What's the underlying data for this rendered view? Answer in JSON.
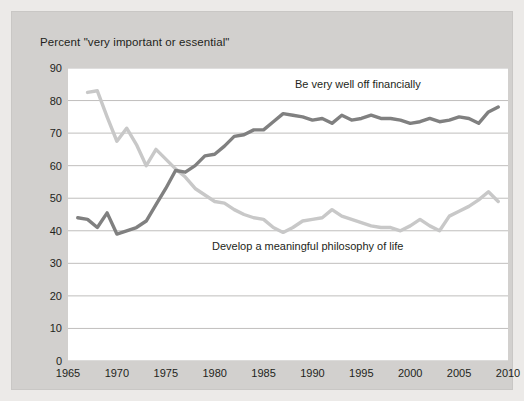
{
  "chart_data": {
    "type": "line",
    "title": "Percent \"very important or essential\"",
    "xlabel": "",
    "ylabel": "",
    "xlim": [
      1965,
      2010
    ],
    "ylim": [
      0,
      90
    ],
    "ytick_values": [
      0,
      10,
      20,
      30,
      40,
      50,
      60,
      70,
      80,
      90
    ],
    "ytick_labels": [
      "0",
      "10",
      "20",
      "30",
      "40",
      "50",
      "60",
      "70",
      "80",
      "90"
    ],
    "xtick_values": [
      1965,
      1970,
      1975,
      1980,
      1985,
      1990,
      1995,
      2000,
      2005,
      2010
    ],
    "xtick_labels": [
      "1965",
      "1970",
      "1975",
      "1980",
      "1985",
      "1990",
      "1995",
      "2000",
      "2005",
      "2010"
    ],
    "grid": "horizontal",
    "legend_position": "inline-annotations",
    "series": [
      {
        "name": "Be very well off financially",
        "color": "#808080",
        "x": [
          1966,
          1967,
          1968,
          1969,
          1970,
          1971,
          1972,
          1973,
          1974,
          1975,
          1976,
          1977,
          1978,
          1979,
          1980,
          1981,
          1982,
          1983,
          1984,
          1985,
          1986,
          1987,
          1988,
          1989,
          1990,
          1991,
          1992,
          1993,
          1994,
          1995,
          1996,
          1997,
          1998,
          1999,
          2000,
          2001,
          2002,
          2003,
          2004,
          2005,
          2006,
          2007,
          2008,
          2009
        ],
        "values": [
          44.0,
          43.5,
          41.0,
          45.5,
          39.0,
          40.0,
          41.0,
          43.0,
          48.0,
          53.0,
          58.5,
          58.0,
          60.0,
          63.0,
          63.5,
          66.0,
          69.0,
          69.5,
          71.0,
          71.0,
          73.5,
          76.0,
          75.5,
          75.0,
          74.0,
          74.5,
          73.0,
          75.5,
          74.0,
          74.5,
          75.5,
          74.5,
          74.5,
          74.0,
          73.0,
          73.5,
          74.5,
          73.5,
          74.0,
          75.0,
          74.5,
          73.0,
          76.5,
          78.0
        ]
      },
      {
        "name": "Develop a meaningful philosophy of life",
        "color": "#c8c8c8",
        "x": [
          1967,
          1968,
          1969,
          1970,
          1971,
          1972,
          1973,
          1974,
          1975,
          1976,
          1977,
          1978,
          1979,
          1980,
          1981,
          1982,
          1983,
          1984,
          1985,
          1986,
          1987,
          1988,
          1989,
          1990,
          1991,
          1992,
          1993,
          1994,
          1995,
          1996,
          1997,
          1998,
          1999,
          2000,
          2001,
          2002,
          2003,
          2004,
          2005,
          2006,
          2007,
          2008,
          2009
        ],
        "values": [
          82.5,
          83.0,
          75.0,
          67.5,
          71.5,
          66.5,
          60.0,
          65.0,
          62.0,
          59.0,
          56.5,
          53.0,
          51.0,
          49.0,
          48.5,
          46.5,
          45.0,
          44.0,
          43.5,
          41.0,
          39.5,
          41.0,
          43.0,
          43.5,
          44.0,
          46.5,
          44.5,
          43.5,
          42.5,
          41.5,
          41.0,
          41.0,
          40.0,
          41.5,
          43.5,
          41.5,
          40.0,
          44.5,
          46.0,
          47.5,
          49.5,
          52.0,
          49.0
        ]
      }
    ],
    "annotations": [
      {
        "text": "Be very well off financially",
        "series": "Be very well off financially"
      },
      {
        "text": "Develop a meaningful philosophy of life",
        "series": "Develop a meaningful philosophy of life"
      }
    ]
  }
}
